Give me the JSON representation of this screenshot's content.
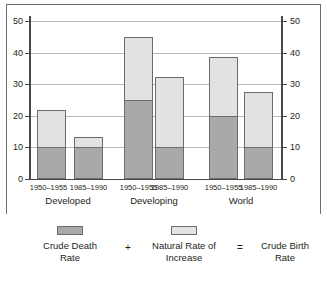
{
  "chart_data": {
    "type": "bar",
    "stacked": true,
    "title": "",
    "xlabel": "",
    "ylabel": "",
    "ylim": [
      0,
      50
    ],
    "yticks": [
      0,
      10,
      20,
      30,
      40,
      50
    ],
    "grid": true,
    "dual_axis": true,
    "left_axis_ticks": [
      "0",
      "10",
      "20",
      "30",
      "40",
      "50"
    ],
    "right_axis_ticks": [
      "0",
      "10",
      "20",
      "30",
      "40",
      "50"
    ],
    "groups": [
      {
        "name": "Developed",
        "bars": [
          {
            "period": "1950–1955",
            "crude_death_rate": 10.0,
            "natural_rate_of_increase": 12.0,
            "crude_birth_rate": 22.0
          },
          {
            "period": "1985–1990",
            "crude_death_rate": 10.0,
            "natural_rate_of_increase": 3.3,
            "crude_birth_rate": 13.3
          }
        ]
      },
      {
        "name": "Developing",
        "bars": [
          {
            "period": "1950–1955",
            "crude_death_rate": 25.0,
            "natural_rate_of_increase": 20.0,
            "crude_birth_rate": 45.0
          },
          {
            "period": "1985–1990",
            "crude_death_rate": 10.0,
            "natural_rate_of_increase": 22.2,
            "crude_birth_rate": 32.2
          }
        ]
      },
      {
        "name": "World",
        "bars": [
          {
            "period": "1950–1955",
            "crude_death_rate": 20.0,
            "natural_rate_of_increase": 18.5,
            "crude_birth_rate": 38.5
          },
          {
            "period": "1985–1990",
            "crude_death_rate": 10.0,
            "natural_rate_of_increase": 17.6,
            "crude_birth_rate": 27.6
          }
        ]
      }
    ],
    "series": [
      {
        "name": "Crude Death Rate",
        "color": "#a9a9a9",
        "values": [
          10.0,
          10.0,
          25.0,
          10.0,
          20.0,
          10.0
        ]
      },
      {
        "name": "Natural Rate of Increase",
        "color": "#e2e2e2",
        "values": [
          12.0,
          3.3,
          20.0,
          22.2,
          18.5,
          17.6
        ]
      }
    ],
    "categories": [
      "Developed 1950–1955",
      "Developed 1985–1990",
      "Developing 1950–1955",
      "Developing 1985–1990",
      "World 1950–1955",
      "World 1985–1990"
    ],
    "legend": {
      "position": "bottom",
      "entries": [
        {
          "label_line1": "Crude Death",
          "label_line2": "Rate",
          "swatch": "dark"
        },
        {
          "label_line1": "Natural Rate of",
          "label_line2": "Increase",
          "swatch": "light"
        },
        {
          "label_line1": "Crude Birth",
          "label_line2": "Rate",
          "swatch": "none"
        }
      ],
      "operators": [
        "+",
        "="
      ]
    },
    "colors": {
      "crude_death_rate": "#a9a9a9",
      "natural_rate_of_increase": "#e2e2e2",
      "bar_outline": "#6c6c6c",
      "gridline": "#b9b9b9",
      "axis": "#4a4a4a",
      "frame": "#6f6f6f",
      "text": "#231f20",
      "background": "#ffffff"
    }
  }
}
